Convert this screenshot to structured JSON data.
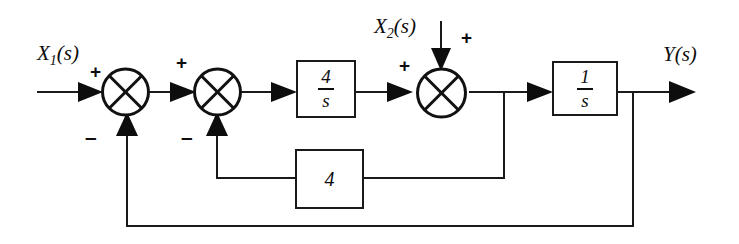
{
  "diagram": {
    "type": "block-diagram",
    "background_color": "#ffffff",
    "line_color": "#1a1a1a"
  },
  "signals": {
    "input_1": {
      "name": "X1(s)",
      "base": "X",
      "subscript": "1",
      "argument": "(s)"
    },
    "input_2": {
      "name": "X2(s)",
      "base": "X",
      "subscript": "2",
      "argument": "(s)"
    },
    "output": {
      "name": "Y(s)",
      "base": "Y",
      "subscript": "",
      "argument": "(s)"
    }
  },
  "summing_junctions": [
    {
      "id": "sum-1",
      "signs": {
        "left_input": "+",
        "bottom_input": "–"
      }
    },
    {
      "id": "sum-2",
      "signs": {
        "left_input": "+",
        "bottom_input": "–"
      }
    },
    {
      "id": "sum-3",
      "signs": {
        "left_input": "+",
        "top_input": "+"
      }
    }
  ],
  "blocks": [
    {
      "id": "block-forward-4-over-s",
      "kind": "fraction",
      "numerator": "4",
      "denominator": "s",
      "label": "4/s"
    },
    {
      "id": "block-integrator-1-over-s",
      "kind": "fraction",
      "numerator": "1",
      "denominator": "s",
      "label": "1/s"
    },
    {
      "id": "block-feedback-gain-4",
      "kind": "gain",
      "gain": "4",
      "label": "4"
    }
  ],
  "signs": {
    "plus_sum1_left": "+",
    "plus_sum2_left": "+",
    "plus_sum3_left": "+",
    "plus_sum3_top": "+",
    "minus_sum1_bottom": "–",
    "minus_sum2_bottom": "–"
  }
}
